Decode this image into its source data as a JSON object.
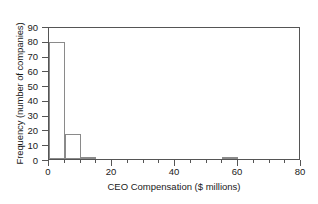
{
  "chart_data": {
    "type": "bar",
    "title": "",
    "subtitle": "",
    "xlabel": "CEO Compensation ($ millions)",
    "ylabel": "Frequency (number of companies)",
    "xlim": [
      0,
      80
    ],
    "ylim": [
      0,
      90
    ],
    "grid": false,
    "legend": null,
    "bin_width": 5,
    "xticks_major": [
      0,
      20,
      40,
      60,
      80
    ],
    "xtick_labels": [
      "0",
      "20",
      "40",
      "60",
      "80"
    ],
    "xticks_minor": [
      5,
      10,
      15,
      25,
      30,
      35,
      45,
      50,
      55,
      65,
      70,
      75
    ],
    "yticks": [
      0,
      10,
      20,
      30,
      40,
      50,
      60,
      70,
      80,
      90
    ],
    "ytick_labels": [
      "0",
      "10",
      "20",
      "30",
      "40",
      "50",
      "60",
      "70",
      "80",
      "90"
    ],
    "bins": [
      {
        "start": 0,
        "end": 5,
        "value": 79
      },
      {
        "start": 5,
        "end": 10,
        "value": 17
      },
      {
        "start": 10,
        "end": 15,
        "value": 1
      },
      {
        "start": 55,
        "end": 60,
        "value": 1
      }
    ],
    "categories": [
      "0-5",
      "5-10",
      "10-15",
      "55-60"
    ],
    "values": [
      79,
      17,
      1,
      1
    ],
    "colors": {
      "bar_fill": "#ffffff",
      "bar_edge": "#8a8a8a",
      "axis": "#555555",
      "text": "#1a1a1a",
      "background": "#ffffff"
    }
  }
}
